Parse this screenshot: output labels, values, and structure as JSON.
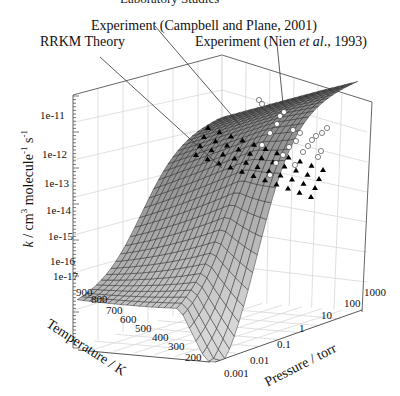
{
  "figure": {
    "clipped_caption": "Laboratory Studies"
  },
  "annotations": [
    {
      "id": "rrkm",
      "text": "RRKM Theory"
    },
    {
      "id": "campbell",
      "text": "Experiment (Campbell and Plane, 2001)"
    },
    {
      "id": "nien_pre",
      "text": "Experiment (Nien "
    },
    {
      "id": "nien_it",
      "text": "et al"
    },
    {
      "id": "nien_post",
      "text": "., 1993)"
    }
  ],
  "chart_data": {
    "type": "surface3d",
    "title": "",
    "xlabel": "Pressure / torr",
    "ylabel": "Temperature / K",
    "zlabel": "k / cm3 molecule-1 s-1",
    "x_scale": "log",
    "x_ticks": [
      "0.001",
      "0.01",
      "0.1",
      "1",
      "10",
      "100",
      "1000"
    ],
    "x_range": [
      0.001,
      1000
    ],
    "y_ticks": [
      "900",
      "800",
      "700",
      "600",
      "500",
      "400",
      "300",
      "200"
    ],
    "y_range": [
      200,
      900
    ],
    "z_scale": "log",
    "z_ticks": [
      "1e-17",
      "1e-16",
      "1e-15",
      "1e-14",
      "1e-13",
      "1e-12",
      "1e-11"
    ],
    "z_range": [
      1e-17,
      1e-10
    ],
    "grid": true,
    "series": [
      {
        "name": "RRKM Theory",
        "kind": "surface",
        "color": "#8a8a8a"
      },
      {
        "name": "Experiment (Campbell and Plane, 2001)",
        "kind": "points",
        "marker": "filled-black"
      },
      {
        "name": "Experiment (Nien et al., 1993)",
        "kind": "points",
        "marker": "open-white"
      }
    ]
  },
  "axis_titles": {
    "z_k": "k",
    "z_rest": " / cm",
    "z_sup3": "3",
    "z_mol": " molecule",
    "z_supm1": "-1",
    "z_s": " s",
    "z_supm1b": "-1",
    "temperature": "Temperature / K",
    "pressure": "Pressure / torr"
  },
  "z_ticks": [
    "1e-11",
    "1e-12",
    "1e-13",
    "1e-14",
    "1e-15",
    "1e-16",
    "1e-17"
  ],
  "t_ticks": [
    "900",
    "800",
    "700",
    "600",
    "500",
    "400",
    "300",
    "200"
  ],
  "p_ticks": [
    "0.001",
    "0.01",
    "0.1",
    "1",
    "10",
    "100",
    "1000"
  ]
}
